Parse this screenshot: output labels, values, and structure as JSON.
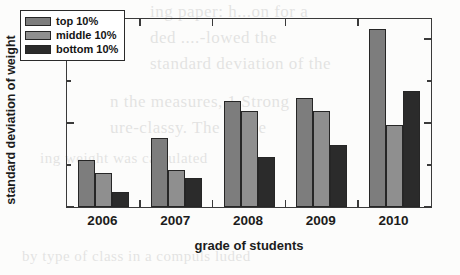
{
  "chart_data": {
    "type": "bar",
    "title": "",
    "xlabel": "grade of students",
    "ylabel": "standard deviation of weight",
    "categories": [
      "2006",
      "2007",
      "2008",
      "2009",
      "2010"
    ],
    "series": [
      {
        "name": "top 10%",
        "color": "#7d7d7d",
        "values": [
          1.78,
          1.91,
          2.13,
          2.15,
          2.56
        ]
      },
      {
        "name": "middle 10%",
        "color": "#8f8f8f",
        "values": [
          1.7,
          1.72,
          2.07,
          2.07,
          1.99
        ]
      },
      {
        "name": "bottom 10%",
        "color": "#2b2b2b",
        "values": [
          1.59,
          1.67,
          1.8,
          1.87,
          2.19
        ]
      }
    ],
    "ylim": [
      1.5,
      2.62
    ],
    "ytick_labels": [
      "1.5",
      "2.0",
      "2.5"
    ],
    "ytick_values": [
      1.5,
      2.0,
      2.5
    ],
    "yminor_values": [
      1.75,
      2.25
    ],
    "grid": false,
    "legend_position": "upper left",
    "axis_color": "#3a3a3a"
  },
  "legend": {
    "items": [
      {
        "label": "top 10%"
      },
      {
        "label": "middle 10%"
      },
      {
        "label": "bottom 10%"
      }
    ]
  },
  "ghost_text": {
    "lines": [
      "ing paper: h...on for a",
      "ded ....-lowed  the",
      "standard deviation of the",
      "n the measures, 1 Strong",
      "ure-classy. The Three",
      "ing weight was calculated",
      "by type of class in a compuls luded"
    ]
  }
}
